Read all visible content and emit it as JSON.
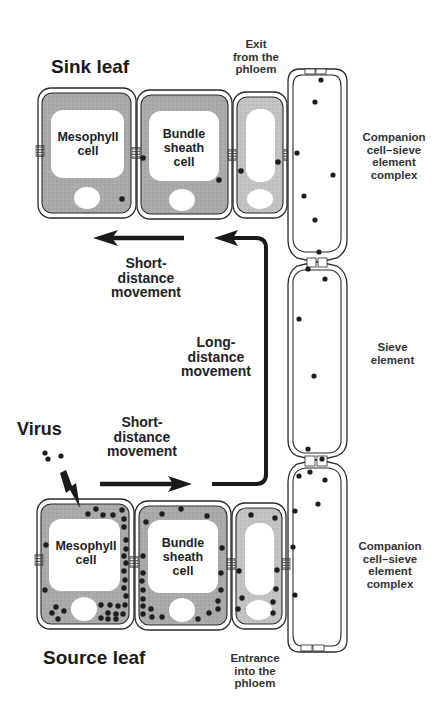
{
  "diagram": {
    "sink_title": "Sink leaf",
    "source_title": "Source leaf",
    "virus_label": "Virus",
    "exit_label": "Exit\nfrom the\nphloem",
    "entrance_label": "Entrance\ninto the\nphloem",
    "upper_complex_label": "Companion\ncell–sieve\nelement\ncomplex",
    "sieve_element_label": "Sieve\nelement",
    "lower_complex_label": "Companion\ncell–sieve\nelement\ncomplex",
    "short_distance_upper": "Short-\ndistance\nmovement",
    "long_distance": "Long-\ndistance\nmovement",
    "short_distance_lower": "Short-\ndistance\nmovement",
    "sink_cells": {
      "mesophyll": "Mesophyll\ncell",
      "bundle_sheath": "Bundle\nsheath\ncell"
    },
    "source_cells": {
      "mesophyll": "Mesophyll\ncell",
      "bundle_sheath": "Bundle\nsheath\ncell"
    },
    "colors": {
      "cytoplasm": "#a9a9a9",
      "cytoplasm_light": "#c4c4c4",
      "outline": "#2a2a2a",
      "virus_particle": "#1e1e1e",
      "arrow": "#1a1a1a",
      "background": "#ffffff"
    }
  }
}
